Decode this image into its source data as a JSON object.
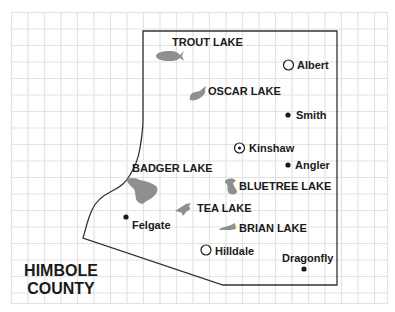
{
  "map": {
    "county_name_line1": "HIMBOLE",
    "county_name_line2": "COUNTY",
    "colors": {
      "grid": "#e3e3e3",
      "boundary": "#333333",
      "lake": "#8f8f8f",
      "text": "#1a1a1a"
    },
    "lakes": [
      {
        "name": "TROUT LAKE"
      },
      {
        "name": "OSCAR LAKE"
      },
      {
        "name": "BADGER LAKE"
      },
      {
        "name": "BLUETREE LAKE"
      },
      {
        "name": "TEA LAKE"
      },
      {
        "name": "BRIAN LAKE"
      }
    ],
    "towns": [
      {
        "name": "Albert",
        "symbol": "open-circle"
      },
      {
        "name": "Smith",
        "symbol": "filled-dot"
      },
      {
        "name": "Kinshaw",
        "symbol": "circled-dot"
      },
      {
        "name": "Angler",
        "symbol": "filled-dot"
      },
      {
        "name": "Felgate",
        "symbol": "filled-dot"
      },
      {
        "name": "Hilldale",
        "symbol": "open-circle"
      },
      {
        "name": "Dragonfly",
        "symbol": "filled-dot"
      }
    ]
  }
}
